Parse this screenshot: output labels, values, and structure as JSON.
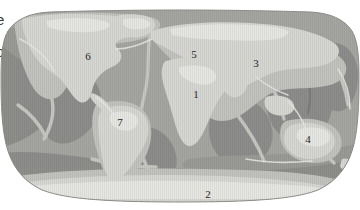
{
  "page": {
    "background_color": "#ffffff",
    "width": 360,
    "height": 210
  },
  "margin_fragments": [
    {
      "id": "frag-e",
      "text": "e"
    },
    {
      "id": "frag-o",
      "text": "o"
    }
  ],
  "figure": {
    "name": "world-map",
    "projection": "Robinson",
    "style": "grayscale shaded relief with ocean bathymetry",
    "colors": {
      "land": "#d5d5d2",
      "land_highlight": "#e3e3e0",
      "shelf": "#c3c3c0",
      "ocean_shallow": "#b8b8b5",
      "ocean_mid": "#a2a29f",
      "ocean_deep": "#8e8e8b",
      "ridge": "#cfcfcc",
      "outline": "#8a8a87",
      "label": "#262626"
    }
  },
  "map_labels": [
    {
      "id": "label-1",
      "number": "1",
      "region": "Africa",
      "x": 196,
      "y": 89
    },
    {
      "id": "label-2",
      "number": "2",
      "region": "Antarctica",
      "x": 208,
      "y": 189
    },
    {
      "id": "label-3",
      "number": "3",
      "region": "Asia",
      "x": 256,
      "y": 58
    },
    {
      "id": "label-4",
      "number": "4",
      "region": "Australia",
      "x": 308,
      "y": 134
    },
    {
      "id": "label-5",
      "number": "5",
      "region": "Europe",
      "x": 194,
      "y": 49
    },
    {
      "id": "label-6",
      "number": "6",
      "region": "North America",
      "x": 88,
      "y": 51
    },
    {
      "id": "label-7",
      "number": "7",
      "region": "South America",
      "x": 120,
      "y": 117
    }
  ]
}
